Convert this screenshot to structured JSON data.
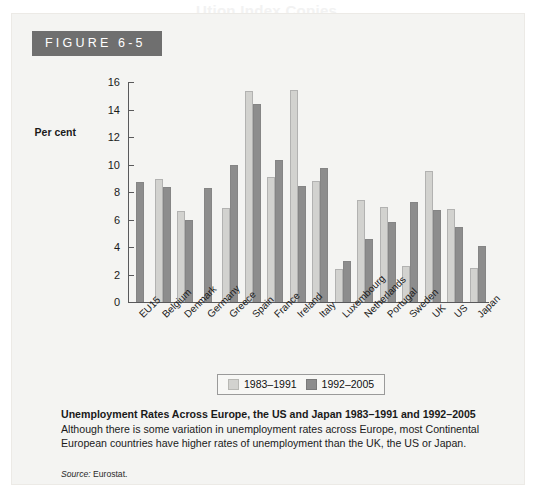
{
  "bleed_text": {
    "line1": "Ution Index Copies",
    "line2": "Unemployment Rates"
  },
  "figure": {
    "tag_label": "FIGURE 6-5"
  },
  "legend": {
    "items": [
      {
        "label": "1983–1991",
        "swatch": "light",
        "color": "#d2d2cf"
      },
      {
        "label": "1992–2005",
        "swatch": "dark",
        "color": "#8d8d8d"
      }
    ]
  },
  "caption": {
    "bold_lead": "Unemployment Rates Across Europe, the US and Japan 1983–1991 and 1992–2005",
    "body": "Although there is some variation in unemployment rates across Europe, most Continental European countries have higher rates of unemployment than the UK, the US or Japan."
  },
  "source": {
    "label": "Source:",
    "value": "Eurostat."
  },
  "chart_data": {
    "type": "bar",
    "title": "Unemployment Rates Across Europe, the US and Japan 1983–1991 and 1992–2005",
    "xlabel": "",
    "ylabel": "Per cent",
    "ylim": [
      0,
      16
    ],
    "yticks": [
      0,
      2,
      4,
      6,
      8,
      10,
      12,
      14,
      16
    ],
    "grid": false,
    "legend_position": "bottom",
    "categories": [
      "EU15",
      "Belgium",
      "Denmark",
      "Germany",
      "Greece",
      "Spain",
      "France",
      "Ireland",
      "Italy",
      "Luxembourg",
      "Netherlands",
      "Portugal",
      "Sweden",
      "UK",
      "US",
      "Japan"
    ],
    "series": [
      {
        "name": "1983–1991",
        "color": "#d2d2cf",
        "values": [
          null,
          8.95,
          6.65,
          null,
          6.85,
          15.35,
          9.1,
          15.4,
          8.8,
          2.4,
          7.4,
          6.9,
          2.6,
          9.55,
          6.75,
          2.5
        ]
      },
      {
        "name": "1992–2005",
        "color": "#8d8d8d",
        "values": [
          8.75,
          8.35,
          5.95,
          8.3,
          9.95,
          14.4,
          10.3,
          8.45,
          9.75,
          3.0,
          4.55,
          5.85,
          7.3,
          6.7,
          5.45,
          4.05
        ]
      }
    ]
  }
}
